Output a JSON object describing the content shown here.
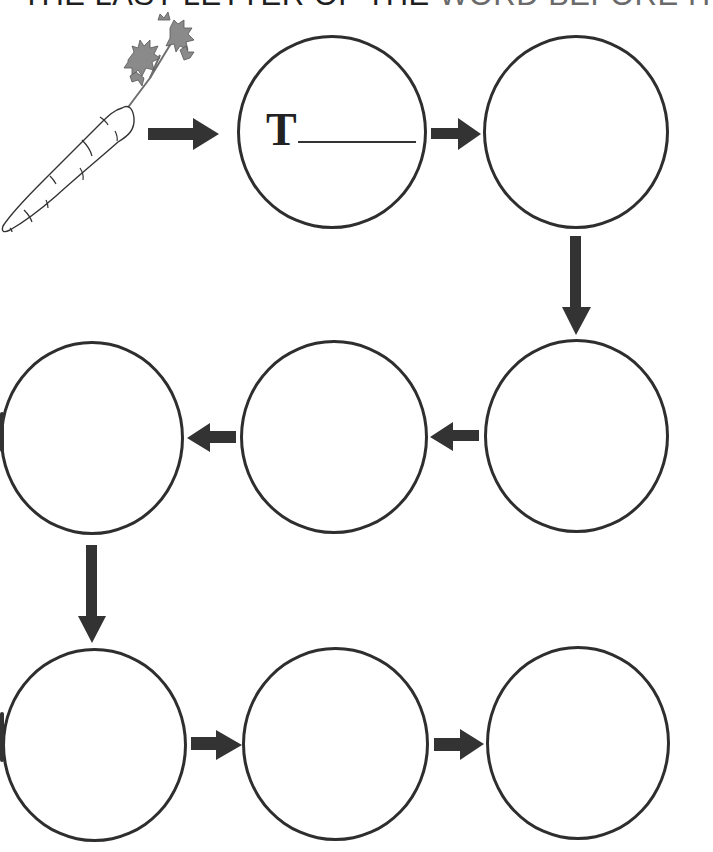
{
  "worksheet": {
    "title": "THE LAST LETTER OF THE WORD BEFORE IT",
    "title_part_dark": "THE LAST LETTER OF THE ",
    "title_part_fade": "WORD BEFORE IT",
    "start_image": "carrot-icon",
    "start_word": "carrot",
    "first_hint_letter": "T",
    "chain": [
      {
        "id": 1,
        "row": 1,
        "hint": "T",
        "value": ""
      },
      {
        "id": 2,
        "row": 1,
        "hint": "",
        "value": ""
      },
      {
        "id": 3,
        "row": 2,
        "hint": "",
        "value": ""
      },
      {
        "id": 4,
        "row": 2,
        "hint": "",
        "value": ""
      },
      {
        "id": 5,
        "row": 2,
        "hint": "",
        "value": ""
      },
      {
        "id": 6,
        "row": 3,
        "hint": "",
        "value": ""
      },
      {
        "id": 7,
        "row": 3,
        "hint": "",
        "value": ""
      },
      {
        "id": 8,
        "row": 3,
        "hint": "",
        "value": ""
      }
    ],
    "arrows": [
      {
        "from": "carrot",
        "to": 1,
        "direction": "right"
      },
      {
        "from": 1,
        "to": 2,
        "direction": "right"
      },
      {
        "from": 2,
        "to": 3,
        "direction": "down"
      },
      {
        "from": 3,
        "to": 4,
        "direction": "left"
      },
      {
        "from": 4,
        "to": 5,
        "direction": "left"
      },
      {
        "from": 5,
        "to": 6,
        "direction": "down"
      },
      {
        "from": 6,
        "to": 7,
        "direction": "right"
      },
      {
        "from": 7,
        "to": 8,
        "direction": "right"
      }
    ],
    "colors": {
      "outline": "#2e2e2e",
      "arrow": "#333333",
      "leaf": "#8a8a8a",
      "background": "#ffffff"
    }
  }
}
